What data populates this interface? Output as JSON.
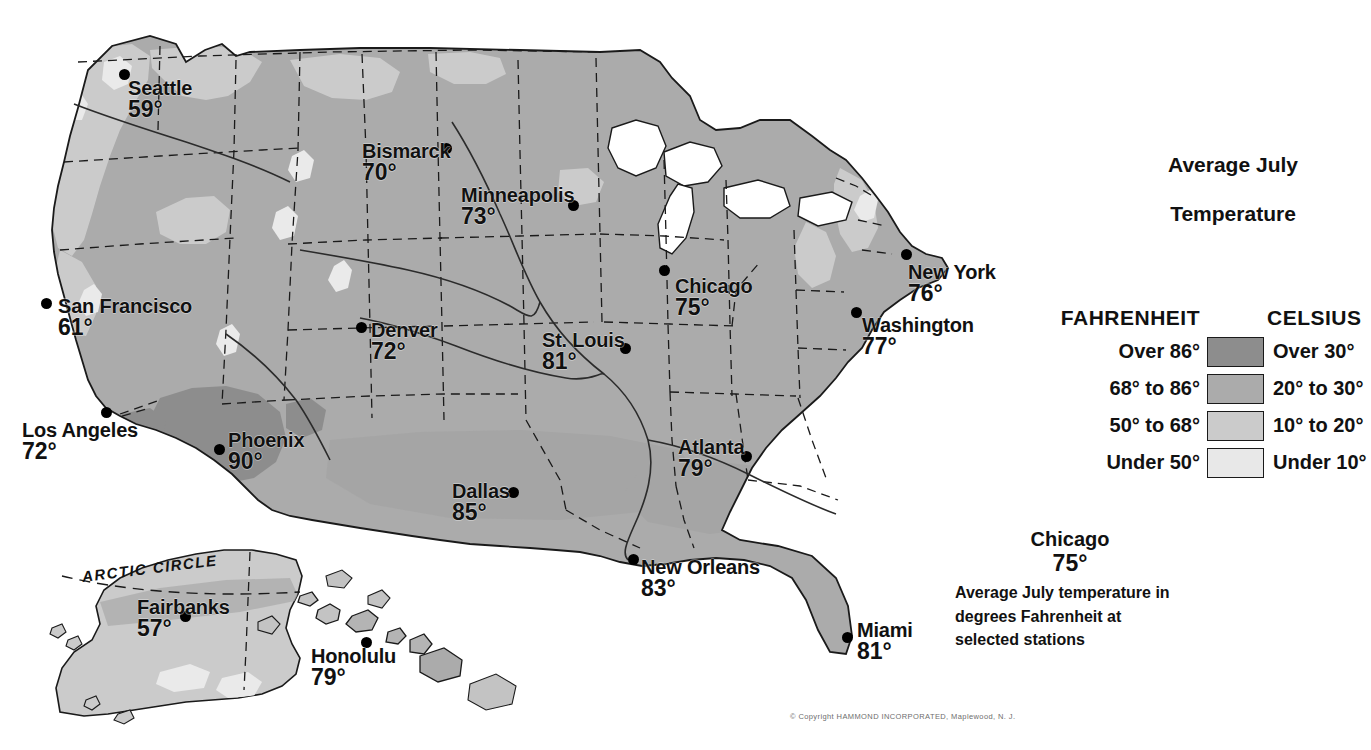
{
  "title": {
    "line1": "Average July",
    "line2": "Temperature"
  },
  "legend": {
    "head_fahrenheit": "FAHRENHEIT",
    "head_celsius": "CELSIUS",
    "rows": [
      {
        "fahrenheit": "Over 86°",
        "celsius": "Over 30°",
        "color": "#8d8d8d"
      },
      {
        "fahrenheit": "68° to 86°",
        "celsius": "20° to 30°",
        "color": "#ababab"
      },
      {
        "fahrenheit": "50° to 68°",
        "celsius": "10° to 20°",
        "color": "#cbcbcb"
      },
      {
        "fahrenheit": "Under 50°",
        "celsius": "Under 10°",
        "color": "#e8e8e8"
      }
    ]
  },
  "caption": {
    "city": "Chicago",
    "temp": "75°",
    "desc": "Average July temperature in degrees Fahrenheit at selected stations"
  },
  "copyright": "© Copyright  HAMMOND  INCORPORATED,  Maplewood,  N. J.",
  "inset_labels": {
    "arctic_circle": "ARCTIC CIRCLE"
  },
  "cities": [
    {
      "name": "Seattle",
      "temp": "59°",
      "label_x": 128,
      "label_y": 78,
      "align": "lft",
      "dot_x": 124,
      "dot_y": 74
    },
    {
      "name": "Bismarck",
      "temp": "70°",
      "label_x": 362,
      "label_y": 141,
      "align": "lft",
      "dot_x": 446,
      "dot_y": 148
    },
    {
      "name": "Minneapolis",
      "temp": "73°",
      "label_x": 461,
      "label_y": 185,
      "align": "lft",
      "dot_x": 573,
      "dot_y": 205
    },
    {
      "name": "San Francisco",
      "temp": "61°",
      "label_x": 58,
      "label_y": 296,
      "align": "lft",
      "dot_x": 46,
      "dot_y": 303
    },
    {
      "name": "Denver",
      "temp": "72°",
      "label_x": 371,
      "label_y": 320,
      "align": "lft",
      "dot_x": 361,
      "dot_y": 327
    },
    {
      "name": "St. Louis",
      "temp": "81°",
      "label_x": 542,
      "label_y": 330,
      "align": "lft",
      "dot_x": 625,
      "dot_y": 348
    },
    {
      "name": "Chicago",
      "temp": "75°",
      "label_x": 675,
      "label_y": 276,
      "align": "lft",
      "dot_x": 664,
      "dot_y": 270
    },
    {
      "name": "New York",
      "temp": "76°",
      "label_x": 908,
      "label_y": 262,
      "align": "lft",
      "dot_x": 906,
      "dot_y": 254
    },
    {
      "name": "Washington",
      "temp": "77°",
      "label_x": 862,
      "label_y": 315,
      "align": "lft",
      "dot_x": 856,
      "dot_y": 312
    },
    {
      "name": "Los Angeles",
      "temp": "72°",
      "label_x": 22,
      "label_y": 420,
      "align": "lft",
      "dot_x": 106,
      "dot_y": 412
    },
    {
      "name": "Phoenix",
      "temp": "90°",
      "label_x": 228,
      "label_y": 430,
      "align": "lft",
      "dot_x": 219,
      "dot_y": 449
    },
    {
      "name": "Atlanta",
      "temp": "79°",
      "label_x": 678,
      "label_y": 437,
      "align": "lft",
      "dot_x": 746,
      "dot_y": 456
    },
    {
      "name": "Dallas",
      "temp": "85°",
      "label_x": 452,
      "label_y": 481,
      "align": "lft",
      "dot_x": 513,
      "dot_y": 492
    },
    {
      "name": "New Orleans",
      "temp": "83°",
      "label_x": 641,
      "label_y": 557,
      "align": "lft",
      "dot_x": 633,
      "dot_y": 559
    },
    {
      "name": "Fairbanks",
      "temp": "57°",
      "label_x": 137,
      "label_y": 597,
      "align": "lft",
      "dot_x": 185,
      "dot_y": 616
    },
    {
      "name": "Miami",
      "temp": "81°",
      "label_x": 857,
      "label_y": 620,
      "align": "lft",
      "dot_x": 847,
      "dot_y": 637
    },
    {
      "name": "Honolulu",
      "temp": "79°",
      "label_x": 311,
      "label_y": 646,
      "align": "lft",
      "dot_x": 366,
      "dot_y": 642
    }
  ]
}
